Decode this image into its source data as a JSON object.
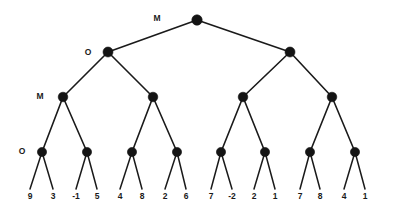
{
  "diagram": {
    "type": "game-tree",
    "title": "",
    "background_color": "#ffffff",
    "node_color": "#141414",
    "edge_color": "#1a1a1a",
    "level_labels": [
      {
        "text": "M",
        "x": 157,
        "y": 19
      },
      {
        "text": "O",
        "x": 88,
        "y": 53
      },
      {
        "text": "M",
        "x": 40,
        "y": 97
      },
      {
        "text": "O",
        "x": 22,
        "y": 152
      }
    ],
    "nodes": [
      {
        "id": "root",
        "x": 197,
        "y": 20,
        "depth": 0,
        "r": 5.2
      },
      {
        "id": "n1-0",
        "x": 108,
        "y": 52,
        "depth": 1,
        "r": 5.0
      },
      {
        "id": "n1-1",
        "x": 290,
        "y": 52,
        "depth": 1,
        "r": 5.0
      },
      {
        "id": "n2-0",
        "x": 63,
        "y": 97,
        "depth": 2,
        "r": 4.8
      },
      {
        "id": "n2-1",
        "x": 153,
        "y": 97,
        "depth": 2,
        "r": 4.8
      },
      {
        "id": "n2-2",
        "x": 243,
        "y": 97,
        "depth": 2,
        "r": 4.8
      },
      {
        "id": "n2-3",
        "x": 332,
        "y": 97,
        "depth": 2,
        "r": 4.8
      },
      {
        "id": "n3-0",
        "x": 42,
        "y": 152,
        "depth": 3,
        "r": 4.6
      },
      {
        "id": "n3-1",
        "x": 87,
        "y": 152,
        "depth": 3,
        "r": 4.6
      },
      {
        "id": "n3-2",
        "x": 132,
        "y": 152,
        "depth": 3,
        "r": 4.6
      },
      {
        "id": "n3-3",
        "x": 177,
        "y": 152,
        "depth": 3,
        "r": 4.6
      },
      {
        "id": "n3-4",
        "x": 221,
        "y": 152,
        "depth": 3,
        "r": 4.6
      },
      {
        "id": "n3-5",
        "x": 265,
        "y": 152,
        "depth": 3,
        "r": 4.6
      },
      {
        "id": "n3-6",
        "x": 310,
        "y": 152,
        "depth": 3,
        "r": 4.6
      },
      {
        "id": "n3-7",
        "x": 355,
        "y": 152,
        "depth": 3,
        "r": 4.6
      }
    ],
    "edges": [
      {
        "from": "root",
        "to": "n1-0"
      },
      {
        "from": "root",
        "to": "n1-1"
      },
      {
        "from": "n1-0",
        "to": "n2-0"
      },
      {
        "from": "n1-0",
        "to": "n2-1"
      },
      {
        "from": "n1-1",
        "to": "n2-2"
      },
      {
        "from": "n1-1",
        "to": "n2-3"
      },
      {
        "from": "n2-0",
        "to": "n3-0"
      },
      {
        "from": "n2-0",
        "to": "n3-1"
      },
      {
        "from": "n2-1",
        "to": "n3-2"
      },
      {
        "from": "n2-1",
        "to": "n3-3"
      },
      {
        "from": "n2-2",
        "to": "n3-4"
      },
      {
        "from": "n2-2",
        "to": "n3-5"
      },
      {
        "from": "n2-3",
        "to": "n3-6"
      },
      {
        "from": "n2-3",
        "to": "n3-7"
      }
    ],
    "leaves": [
      {
        "value": "9",
        "x": 30,
        "y": 197,
        "parent": "n3-0"
      },
      {
        "value": "3",
        "x": 53,
        "y": 197,
        "parent": "n3-0"
      },
      {
        "value": "-1",
        "x": 76,
        "y": 197,
        "parent": "n3-1"
      },
      {
        "value": "5",
        "x": 97,
        "y": 197,
        "parent": "n3-1"
      },
      {
        "value": "4",
        "x": 120,
        "y": 197,
        "parent": "n3-2"
      },
      {
        "value": "8",
        "x": 142,
        "y": 197,
        "parent": "n3-2"
      },
      {
        "value": "2",
        "x": 165,
        "y": 197,
        "parent": "n3-3"
      },
      {
        "value": "6",
        "x": 186,
        "y": 197,
        "parent": "n3-3"
      },
      {
        "value": "7",
        "x": 211,
        "y": 197,
        "parent": "n3-4"
      },
      {
        "value": "-2",
        "x": 232,
        "y": 197,
        "parent": "n3-4"
      },
      {
        "value": "2",
        "x": 254,
        "y": 197,
        "parent": "n3-5"
      },
      {
        "value": "1",
        "x": 275,
        "y": 197,
        "parent": "n3-5"
      },
      {
        "value": "7",
        "x": 300,
        "y": 197,
        "parent": "n3-6"
      },
      {
        "value": "8",
        "x": 320,
        "y": 197,
        "parent": "n3-6"
      },
      {
        "value": "4",
        "x": 344,
        "y": 197,
        "parent": "n3-7"
      },
      {
        "value": "1",
        "x": 365,
        "y": 197,
        "parent": "n3-7"
      }
    ],
    "leaf_edge_top_y": 152,
    "leaf_edge_bottom_y": 189
  },
  "chart_data": {
    "type": "table",
    "xlabel": "",
    "ylabel": "",
    "categories": [
      "9",
      "3",
      "-1",
      "5",
      "4",
      "8",
      "2",
      "6",
      "7",
      "-2",
      "2",
      "1",
      "7",
      "8",
      "4",
      "1"
    ],
    "values": [
      9,
      3,
      -1,
      5,
      4,
      8,
      2,
      6,
      7,
      -2,
      2,
      1,
      7,
      8,
      4,
      1
    ],
    "legend": [
      "M = maximizing level",
      "O = minimizing level"
    ],
    "annotations": [
      "M",
      "O",
      "M",
      "O"
    ]
  }
}
